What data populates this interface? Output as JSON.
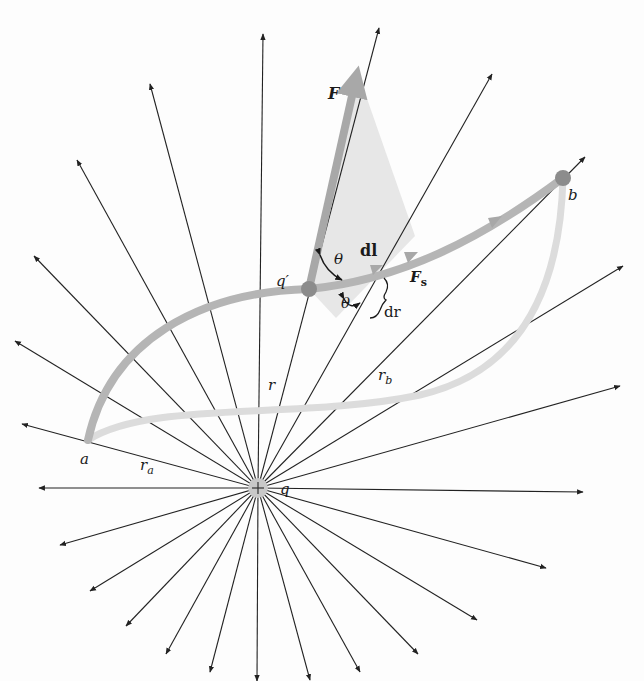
{
  "diagram": {
    "center_charge": {
      "label": "q",
      "sign": "+",
      "x": 258,
      "y": 488
    },
    "field_lines": [
      [
        263,
        34
      ],
      [
        379,
        28
      ],
      [
        492,
        74
      ],
      [
        585,
        157
      ],
      [
        623,
        266
      ],
      [
        620,
        386
      ],
      [
        583,
        492
      ],
      [
        546,
        568
      ],
      [
        477,
        620
      ],
      [
        418,
        654
      ],
      [
        360,
        672
      ],
      [
        310,
        680
      ],
      [
        257,
        681
      ],
      [
        210,
        672
      ],
      [
        166,
        654
      ],
      [
        126,
        626
      ],
      [
        90,
        591
      ],
      [
        60,
        545
      ],
      [
        39,
        488
      ],
      [
        22,
        424
      ],
      [
        15,
        341
      ],
      [
        34,
        256
      ],
      [
        77,
        160
      ],
      [
        150,
        84
      ]
    ],
    "points": {
      "a": {
        "label": "a",
        "x": 88,
        "y": 440
      },
      "q_prime": {
        "label": "q′",
        "x": 309,
        "y": 289
      },
      "b": {
        "label": "b",
        "x": 563,
        "y": 178
      }
    },
    "labels": {
      "F": "F",
      "theta_top": "θ",
      "theta_bottom": "θ",
      "dl": "dl",
      "Fs_main": "F",
      "Fs_sub": "s",
      "dr": "dr",
      "r": "r",
      "r_a_main": "r",
      "r_a_sub": "a",
      "r_b_main": "r",
      "r_b_sub": "b",
      "a": "a",
      "b": "b",
      "q": "q",
      "q_prime": "q′"
    },
    "colors": {
      "line": "#222222",
      "path_main": "#b5b5b5",
      "path_alt": "#dcdcdc",
      "vector": "#a8a8a8",
      "triangle_fill": "#e4e4e4",
      "charge_dot": "#8c8c8c"
    }
  }
}
